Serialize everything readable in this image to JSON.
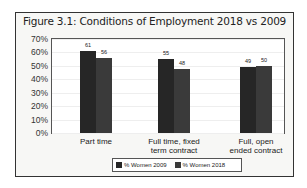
{
  "chart_data": {
    "type": "bar",
    "title": "Figure 3.1: Conditions of Employment  2018 vs 2009",
    "categories": [
      "Part time",
      "Full time, fixed term contract",
      "Full, open ended contract"
    ],
    "category_lines": [
      [
        "Part time"
      ],
      [
        "Full time, fixed",
        "term contract"
      ],
      [
        "Full, open",
        "ended contract"
      ]
    ],
    "series": [
      {
        "name": "% Women 2009",
        "values": [
          61,
          55,
          49
        ],
        "color": "#262626"
      },
      {
        "name": "% Women 2018",
        "values": [
          56,
          48,
          50
        ],
        "color": "#3a3a3a"
      }
    ],
    "xlabel": "",
    "ylabel": "",
    "ylim": [
      0,
      70
    ],
    "yticks": [
      "0%",
      "10%",
      "20%",
      "30%",
      "40%",
      "50%",
      "60%",
      "70%"
    ],
    "grid": true,
    "legend_position": "bottom"
  }
}
